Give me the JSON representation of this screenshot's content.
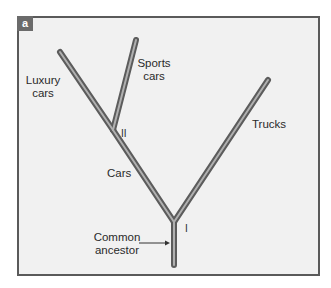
{
  "panel": {
    "tag": "a"
  },
  "tree": {
    "nodes": [
      {
        "id": "common",
        "x": 174,
        "y": 265
      },
      {
        "id": "I",
        "x": 174,
        "y": 222
      },
      {
        "id": "II",
        "x": 113,
        "y": 130
      },
      {
        "id": "luxury",
        "x": 60,
        "y": 52
      },
      {
        "id": "sports",
        "x": 136,
        "y": 40
      },
      {
        "id": "trucks",
        "x": 268,
        "y": 80
      }
    ],
    "branch_color": "#5c5c5c",
    "branch_highlight": "#b8b8b8"
  },
  "labels": {
    "luxury_line1": "Luxury",
    "luxury_line2": "cars",
    "sports_line1": "Sports",
    "sports_line2": "cars",
    "trucks": "Trucks",
    "cars": "Cars",
    "node_II": "II",
    "node_I": "I",
    "common_line1": "Common",
    "common_line2": "ancestor"
  }
}
